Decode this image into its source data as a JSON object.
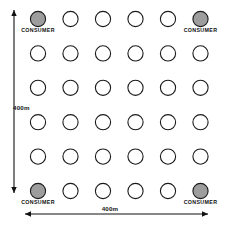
{
  "diagram": {
    "grid": {
      "rows": 6,
      "columns": 6,
      "column_x": [
        38,
        70.5,
        103,
        135.5,
        168,
        200.5
      ],
      "row_y": [
        19,
        53.4,
        87.8,
        122.2,
        156.6,
        191
      ],
      "node_radius": 7.6
    },
    "consumers": [
      {
        "id": "consumer-top-left",
        "row": 0,
        "col": 0,
        "label": "CONSUMER",
        "label_anchor": "middle",
        "label_x": 38,
        "label_y": 31.5
      },
      {
        "id": "consumer-top-right",
        "row": 0,
        "col": 5,
        "label": "CONSUMER",
        "label_anchor": "middle",
        "label_x": 200.5,
        "label_y": 31.5
      },
      {
        "id": "consumer-bottom-left",
        "row": 5,
        "col": 0,
        "label": "CONSUMER",
        "label_anchor": "middle",
        "label_x": 38,
        "label_y": 203.5
      },
      {
        "id": "consumer-bottom-right",
        "row": 5,
        "col": 5,
        "label": "CONSUMER",
        "label_anchor": "middle",
        "label_x": 200.5,
        "label_y": 203.5
      }
    ],
    "dimensions": {
      "vertical": {
        "label": "400m",
        "label_x": 13,
        "label_y": 110,
        "axis_x": 14,
        "start_y": 10,
        "end_y": 193
      },
      "horizontal": {
        "label": "400m",
        "label_x": 110,
        "label_y": 211,
        "axis_y": 214,
        "start_x": 25,
        "end_x": 208
      }
    },
    "colors": {
      "consumer_fill": "#9d9d9d",
      "node_fill": "#ffffff",
      "stroke": "#1a1a1a",
      "text": "#111111",
      "background": "#ffffff"
    }
  }
}
